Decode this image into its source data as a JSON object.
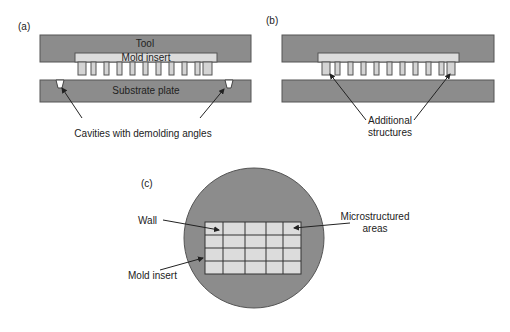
{
  "panels": {
    "a": {
      "label": "(a)",
      "tool": "Tool",
      "mold_insert": "Mold insert",
      "substrate": "Substrate plate",
      "caption": "Cavities with demolding angles"
    },
    "b": {
      "label": "(b)",
      "caption_line1": "Additional",
      "caption_line2": "structures"
    },
    "c": {
      "label": "(c)",
      "wall": "Wall",
      "micro_line1": "Microstructured",
      "micro_line2": "areas",
      "mold_insert": "Mold insert",
      "grid": {
        "columns": 5,
        "rows": 4
      }
    }
  },
  "colors": {
    "dark_gray": "#8c8c8c",
    "light_gray": "#dcdcdc",
    "stroke": "#444444"
  }
}
